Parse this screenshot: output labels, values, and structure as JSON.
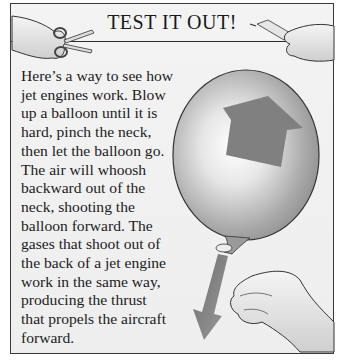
{
  "panel": {
    "title": "TEST IT OUT!",
    "body_lines": [
      "Here’s a way to see how",
      "jet engines work. Blow",
      "up a balloon until it is",
      "hard, pinch the neck,",
      "then let the balloon go.",
      "The air will whoosh",
      "backward out of the",
      "neck, shooting the",
      "balloon forward. The",
      "gases that shoot out of",
      "the back of a jet engine",
      "work in the same way,",
      "producing the thrust",
      "that propels the aircraft",
      "forward."
    ],
    "illustrations": {
      "left_header": "hand-with-scissors-icon",
      "right_header": "hand-with-glue-tube-icon",
      "main": "balloon-with-up-arrow",
      "thrust": "down-arrow",
      "pinch": "pinching-hand"
    },
    "colors": {
      "border": "#3a3a3a",
      "background": "#eeeeee",
      "arrow": "#7a7a7a"
    }
  }
}
